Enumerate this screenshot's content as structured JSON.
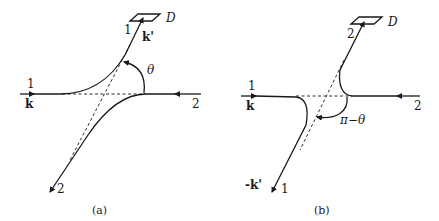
{
  "figure": {
    "panels": [
      {
        "id": "a",
        "caption": "(a)",
        "detector_label": "D",
        "incoming_left": {
          "label_number": "1",
          "label_vector": "k"
        },
        "incoming_right": {
          "label_number": "2"
        },
        "outgoing_to_detector": {
          "label_number": "1",
          "label_vector": "k'"
        },
        "outgoing_away": {
          "label_number": "2"
        },
        "angle_label": "θ"
      },
      {
        "id": "b",
        "caption": "(b)",
        "detector_label": "D",
        "incoming_left": {
          "label_number": "1",
          "label_vector": "k"
        },
        "incoming_right": {
          "label_number": "2"
        },
        "outgoing_to_detector": {
          "label_number": "2"
        },
        "outgoing_away": {
          "label_number": "1",
          "label_vector": "-k'"
        },
        "angle_label": "π−θ"
      }
    ],
    "colors": {
      "ink": "#1a1a1a",
      "background": "#ffffff"
    }
  }
}
